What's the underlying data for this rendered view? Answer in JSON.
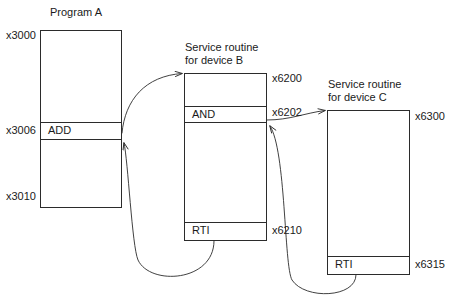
{
  "diagram": {
    "title_note": "Interrupt-driven I/O: nested service routines",
    "type": "memory-map-control-flow",
    "stroke_color": "#2b2b2b",
    "text_color": "#1a1a1a",
    "background": "#ffffff"
  },
  "programs": [
    {
      "id": "program-a",
      "heading": "Program A",
      "heading_lines": [
        "Program A"
      ],
      "addresses": [
        {
          "label": "x3000",
          "position": "top"
        },
        {
          "label": "x3006",
          "position": "instruction"
        },
        {
          "label": "x3010",
          "position": "bottom"
        }
      ],
      "cells": [
        {
          "text": "",
          "kind": "empty"
        },
        {
          "text": "ADD",
          "kind": "instruction"
        },
        {
          "text": "",
          "kind": "empty"
        }
      ]
    },
    {
      "id": "service-routine-b",
      "heading": "Service routine for device B",
      "heading_lines": [
        "Service routine",
        "for device B"
      ],
      "addresses": [
        {
          "label": "x6200",
          "position": "top"
        },
        {
          "label": "x6202",
          "position": "instruction"
        },
        {
          "label": "x6210",
          "position": "return"
        }
      ],
      "cells": [
        {
          "text": "",
          "kind": "empty"
        },
        {
          "text": "AND",
          "kind": "instruction"
        },
        {
          "text": "",
          "kind": "empty"
        },
        {
          "text": "RTI",
          "kind": "return"
        }
      ]
    },
    {
      "id": "service-routine-c",
      "heading": "Service routine for device C",
      "heading_lines": [
        "Service routine",
        "for device C"
      ],
      "addresses": [
        {
          "label": "x6300",
          "position": "top"
        },
        {
          "label": "x6315",
          "position": "return"
        }
      ],
      "cells": [
        {
          "text": "",
          "kind": "empty"
        },
        {
          "text": "RTI",
          "kind": "return"
        }
      ]
    }
  ],
  "arrows": [
    {
      "id": "a-to-b",
      "from": "program-a.ADD",
      "to": "service-routine-b.top"
    },
    {
      "id": "b-rti-to-a",
      "from": "service-routine-b.RTI",
      "to": "program-a.after-ADD"
    },
    {
      "id": "b-to-c",
      "from": "service-routine-b.AND",
      "to": "service-routine-c.top"
    },
    {
      "id": "c-rti-to-b",
      "from": "service-routine-c.RTI",
      "to": "service-routine-b.after-AND"
    }
  ]
}
